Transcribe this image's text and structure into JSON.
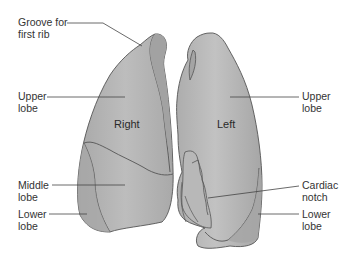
{
  "figure": {
    "colors": {
      "lung_fill": "#b3b3b3",
      "lung_highlight": "#c4c4c4",
      "lung_shadow": "#9c9c9c",
      "outline": "#555555",
      "leader_line": "#444444",
      "text": "#333333"
    },
    "lungs": {
      "right": {
        "name": "Right"
      },
      "left": {
        "name": "Left"
      }
    },
    "labels_left": [
      {
        "line1": "Groove for",
        "line2": "first rib"
      },
      {
        "line1": "Upper",
        "line2": "lobe"
      },
      {
        "line1": "Middle",
        "line2": "lobe"
      },
      {
        "line1": "Lower",
        "line2": "lobe"
      }
    ],
    "labels_right": [
      {
        "line1": "Upper",
        "line2": "lobe"
      },
      {
        "line1": "Cardiac",
        "line2": "notch"
      },
      {
        "line1": "Lower",
        "line2": "lobe"
      }
    ]
  }
}
